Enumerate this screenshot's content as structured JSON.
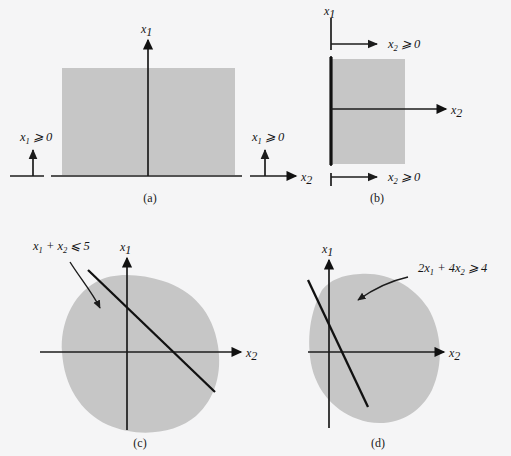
{
  "figure": {
    "background_color": "#f5f5f6",
    "region_color": "#c6c6c6",
    "ink_color": "#111111",
    "width": 511,
    "height": 456
  },
  "panels": [
    {
      "id": "a",
      "caption": "(a)",
      "caption_pos": {
        "x": 150,
        "y": 202
      },
      "vertical_axis_label": "x",
      "vertical_axis_sub": "1",
      "horizontal_axis_label": "x",
      "horizontal_axis_sub": "2",
      "constraint_labels": [
        {
          "text": "x",
          "sub": "1",
          "rel": " ⩾ 0",
          "x": 20,
          "y": 141
        },
        {
          "text": "x",
          "sub": "1",
          "rel": " ⩾ 0",
          "x": 252,
          "y": 141
        }
      ],
      "region": {
        "x": 62,
        "y": 68,
        "w": 173,
        "h": 107
      },
      "axes": {
        "vertical_x": 148,
        "vertical_top": 38,
        "vertical_bottom": 176,
        "horizontal_y": 176,
        "horizontal_left": 10,
        "horizontal_right": 300
      },
      "indicator_arrows": [
        {
          "x": 33,
          "y_base": 176,
          "y_tip": 148
        },
        {
          "x": 265,
          "y_base": 176,
          "y_tip": 148
        }
      ],
      "axis_breaks": [
        {
          "x": 47,
          "y": 176
        },
        {
          "x": 246,
          "y": 176
        }
      ]
    },
    {
      "id": "b",
      "caption": "(b)",
      "caption_pos": {
        "x": 377,
        "y": 202
      },
      "vertical_axis_label": "x",
      "vertical_axis_sub": "1",
      "horizontal_axis_label": "x",
      "horizontal_axis_sub": "2",
      "constraint_labels": [
        {
          "text": "x",
          "sub": "2",
          "rel": " ⩾ 0",
          "x": 388,
          "y": 47
        },
        {
          "text": "x",
          "sub": "2",
          "rel": " ⩾ 0",
          "x": 388,
          "y": 180
        }
      ],
      "region": {
        "x": 331,
        "y": 59,
        "w": 74,
        "h": 105
      },
      "axes": {
        "vertical_x": 331,
        "vertical_top": 18,
        "vertical_bottom": 186,
        "thick_top": 57,
        "thick_bottom": 165,
        "horizontal_y": 109,
        "horizontal_left": 331,
        "horizontal_right": 450
      },
      "indicator_arrows": [
        {
          "y": 44,
          "x_base": 331,
          "x_tip": 381
        },
        {
          "y": 177,
          "x_base": 331,
          "x_tip": 381
        }
      ]
    },
    {
      "id": "c",
      "caption": "(c)",
      "caption_pos": {
        "x": 140,
        "y": 447
      },
      "vertical_axis_label": "x",
      "vertical_axis_sub": "1",
      "horizontal_axis_label": "x",
      "horizontal_axis_sub": "2",
      "constraint": {
        "lhs": "x",
        "sub1": "1",
        "mid": " + x",
        "sub2": "2",
        "rel": " ⩽ 5",
        "label_x": 33,
        "label_y": 250
      },
      "axes": {
        "vertical_x": 127,
        "vertical_top": 256,
        "vertical_bottom": 430,
        "horizontal_y": 352,
        "horizontal_left": 40,
        "horizontal_right": 245
      },
      "region_path": "M 96 282 C 72 295 60 325 62 352 C 64 385 80 412 108 425 C 138 438 175 434 196 416 C 216 398 222 372 218 346 C 213 312 192 290 163 281 C 140 274 114 272 96 282 Z",
      "constraint_line": {
        "x1": 88,
        "y1": 270,
        "x2": 215,
        "y2": 392
      },
      "leader": {
        "path": "M 70 262 C 80 278 92 292 100 308",
        "arrow_x": 101,
        "arrow_y": 311
      }
    },
    {
      "id": "d",
      "caption": "(d)",
      "caption_pos": {
        "x": 378,
        "y": 447
      },
      "vertical_axis_label": "x",
      "vertical_axis_sub": "1",
      "horizontal_axis_label": "x",
      "horizontal_axis_sub": "2",
      "constraint": {
        "lhs": "2x",
        "sub1": "1",
        "mid": " + 4x",
        "sub2": "2",
        "rel": " ⩾ 4",
        "label_x": 418,
        "label_y": 272
      },
      "axes": {
        "vertical_x": 329,
        "vertical_top": 258,
        "vertical_bottom": 428,
        "horizontal_y": 352,
        "horizontal_left": 308,
        "horizontal_right": 448
      },
      "region_path": "M 322 290 C 310 312 306 340 312 368 C 319 396 340 416 368 422 C 396 427 420 414 432 390 C 444 364 442 332 428 308 C 412 284 386 272 360 274 C 342 275 330 280 322 290 Z",
      "constraint_line": {
        "x1": 308,
        "y1": 280,
        "x2": 368,
        "y2": 407
      },
      "leader": {
        "path": "M 408 277 C 390 281 372 290 358 300",
        "arrow_x": 356,
        "arrow_y": 302
      }
    }
  ]
}
